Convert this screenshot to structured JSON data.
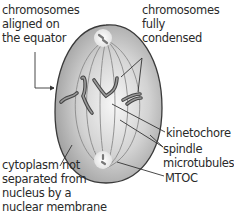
{
  "diagram": {
    "labels": {
      "chromosomes_aligned": [
        "chromosomes",
        "aligned on",
        "the equator"
      ],
      "chromosomes_condensed": [
        "chromosomes",
        "fully",
        "condensed"
      ],
      "kinetochore": [
        "kinetochore"
      ],
      "spindle": [
        "spindle",
        "microtubules"
      ],
      "mtoc": [
        "MTOC"
      ],
      "cytoplasm": [
        "cytoplasm not",
        "separated from",
        "nucleus by a",
        "nuclear membrane"
      ]
    },
    "colors": {
      "cell_fill_center": "#f4f4f4",
      "cell_fill_edge": "#9a9a9a",
      "cell_outline": "#3a3a3a",
      "chromosome": "#5a5a5a",
      "leader_line": "#333333",
      "text": "#2a2a2a"
    }
  }
}
